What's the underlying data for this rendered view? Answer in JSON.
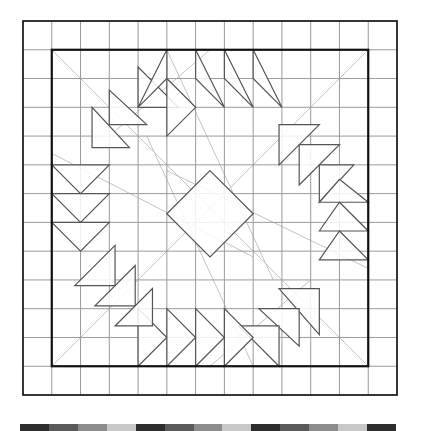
{
  "diagram": {
    "grid": {
      "columns": 13,
      "rows": 13,
      "origin": [
        23,
        21
      ],
      "cell_size": 28.77,
      "grid_line_color": "#9a9a9a",
      "border_color": "#111111",
      "guide_line_color": "#c4c4c4",
      "shape_stroke_color": "#555555"
    },
    "outer_border": {
      "col": 0,
      "row": 0,
      "span": 13
    },
    "inner_border": {
      "col": 1,
      "row": 1,
      "span": 11
    },
    "center_diamond": [
      [
        6.5,
        5.2
      ],
      [
        8.0,
        6.7
      ],
      [
        6.5,
        8.2
      ],
      [
        5.0,
        6.7
      ]
    ],
    "guide_lines": [
      [
        [
          1.0,
          12.0
        ],
        [
          12.0,
          1.0
        ]
      ],
      [
        [
          1.0,
          1.0
        ],
        [
          12.0,
          12.0
        ]
      ],
      [
        [
          1.0,
          4.6
        ],
        [
          8.0,
          8.2
        ]
      ],
      [
        [
          5.0,
          1.0
        ],
        [
          8.7,
          9.0
        ]
      ],
      [
        [
          12.0,
          8.6
        ],
        [
          5.0,
          5.2
        ]
      ],
      [
        [
          8.0,
          12.0
        ],
        [
          4.3,
          4.0
        ]
      ],
      [
        [
          3.0,
          4.0
        ],
        [
          6.5,
          1.0
        ]
      ],
      [
        [
          10.0,
          9.0
        ],
        [
          6.5,
          12.0
        ]
      ]
    ],
    "triangles": [
      [
        [
          4.0,
          1.6
        ],
        [
          4.0,
          3.0
        ],
        [
          5.4,
          3.0
        ]
      ],
      [
        [
          3.0,
          2.4
        ],
        [
          3.0,
          3.6
        ],
        [
          4.3,
          3.6
        ]
      ],
      [
        [
          2.4,
          3.0
        ],
        [
          2.4,
          4.4
        ],
        [
          3.7,
          4.4
        ]
      ],
      [
        [
          4.0,
          3.0
        ],
        [
          5.0,
          2.0
        ],
        [
          5.0,
          1.0
        ]
      ],
      [
        [
          5.0,
          2.0
        ],
        [
          6.0,
          3.0
        ],
        [
          5.0,
          4.0
        ]
      ],
      [
        [
          6.0,
          1.0
        ],
        [
          6.0,
          2.0
        ],
        [
          7.0,
          3.0
        ]
      ],
      [
        [
          7.0,
          1.0
        ],
        [
          7.0,
          2.0
        ],
        [
          8.0,
          3.0
        ]
      ],
      [
        [
          8.0,
          1.0
        ],
        [
          8.0,
          2.0
        ],
        [
          9.0,
          3.0
        ]
      ],
      [
        [
          8.9,
          3.6
        ],
        [
          10.3,
          3.6
        ],
        [
          8.9,
          5.0
        ]
      ],
      [
        [
          9.6,
          4.3
        ],
        [
          11.0,
          4.3
        ],
        [
          9.6,
          5.7
        ]
      ],
      [
        [
          10.3,
          5.0
        ],
        [
          11.5,
          5.0
        ],
        [
          10.3,
          6.3
        ]
      ],
      [
        [
          10.3,
          6.3
        ],
        [
          11.0,
          5.5
        ],
        [
          12.0,
          6.3
        ]
      ],
      [
        [
          10.3,
          7.3
        ],
        [
          11.0,
          6.3
        ],
        [
          12.0,
          7.3
        ]
      ],
      [
        [
          10.3,
          8.3
        ],
        [
          11.0,
          7.3
        ],
        [
          12.0,
          8.3
        ]
      ],
      [
        [
          8.9,
          9.3
        ],
        [
          10.3,
          9.3
        ],
        [
          10.3,
          10.9
        ]
      ],
      [
        [
          8.2,
          10.0
        ],
        [
          9.6,
          10.0
        ],
        [
          9.6,
          11.3
        ]
      ],
      [
        [
          7.5,
          10.6
        ],
        [
          8.9,
          10.6
        ],
        [
          8.9,
          12.0
        ]
      ],
      [
        [
          4.0,
          10.0
        ],
        [
          5.0,
          11.0
        ],
        [
          4.0,
          12.0
        ]
      ],
      [
        [
          5.0,
          10.0
        ],
        [
          6.0,
          11.0
        ],
        [
          5.0,
          12.0
        ]
      ],
      [
        [
          6.0,
          10.0
        ],
        [
          7.0,
          11.0
        ],
        [
          6.0,
          12.0
        ]
      ],
      [
        [
          7.0,
          10.0
        ],
        [
          8.0,
          11.0
        ],
        [
          7.0,
          12.0
        ]
      ],
      [
        [
          1.0,
          5.0
        ],
        [
          2.0,
          6.0
        ],
        [
          3.0,
          5.0
        ]
      ],
      [
        [
          1.0,
          6.0
        ],
        [
          2.0,
          7.0
        ],
        [
          3.0,
          6.0
        ]
      ],
      [
        [
          1.0,
          7.0
        ],
        [
          2.0,
          8.0
        ],
        [
          3.0,
          7.0
        ]
      ],
      [
        [
          1.8,
          9.2
        ],
        [
          3.2,
          9.2
        ],
        [
          3.2,
          7.8
        ]
      ],
      [
        [
          2.5,
          9.9
        ],
        [
          3.9,
          9.9
        ],
        [
          3.9,
          8.5
        ]
      ],
      [
        [
          3.2,
          10.6
        ],
        [
          4.5,
          10.6
        ],
        [
          4.5,
          9.3
        ]
      ]
    ]
  },
  "swatch_strip": {
    "colors": [
      "#2e2e2e",
      "#5a5a5a",
      "#8c8c8c",
      "#c8c8c8",
      "#2e2e2e",
      "#5a5a5a",
      "#8c8c8c",
      "#c8c8c8",
      "#2e2e2e",
      "#5a5a5a",
      "#8c8c8c",
      "#c8c8c8",
      "#2e2e2e"
    ]
  }
}
